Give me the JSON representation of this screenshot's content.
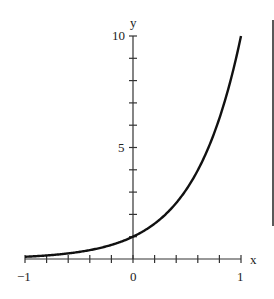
{
  "chart_data": {
    "type": "line",
    "title": "",
    "function": "y = 10^x",
    "xlabel": "x",
    "ylabel": "y",
    "xlim": [
      -1,
      1
    ],
    "ylim": [
      0,
      10
    ],
    "x_tick_labels": [
      "-1",
      "0",
      "1"
    ],
    "y_tick_labels": [
      "5",
      "10"
    ],
    "x_minor_ticks": 10,
    "y_minor_ticks": 10,
    "grid": false,
    "series": [
      {
        "name": "10^x",
        "x": [
          -1,
          -0.8,
          -0.6,
          -0.4,
          -0.2,
          0,
          0.2,
          0.4,
          0.6,
          0.8,
          1
        ],
        "values": [
          0.1,
          0.16,
          0.25,
          0.4,
          0.63,
          1,
          1.58,
          2.51,
          3.98,
          6.31,
          10
        ]
      }
    ]
  },
  "labels": {
    "x_axis": "x",
    "y_axis": "y",
    "x_min": "−1",
    "x_zero": "0",
    "x_max": "1",
    "y_mid": "5",
    "y_max": "10"
  }
}
